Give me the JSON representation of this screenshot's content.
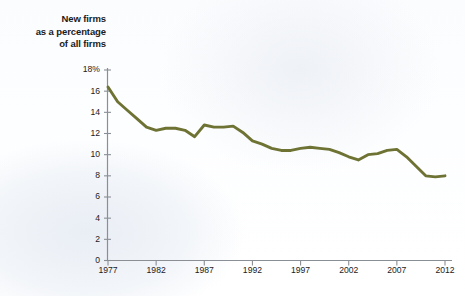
{
  "figure": {
    "title": "New firms\nas a percentage\nof all firms",
    "line_color": "#6e7334",
    "axis_color": "#8a8f96",
    "text_color": "#1b1b1b",
    "background_color": "#fbfcfe"
  },
  "chart_data": {
    "type": "line",
    "title": "New firms as a percentage of all firms",
    "xlabel": "",
    "ylabel": "New firms as a percentage of all firms",
    "xlim": [
      1977,
      2012
    ],
    "ylim": [
      0,
      18
    ],
    "ytick_labels": [
      "0",
      "2",
      "4",
      "6",
      "8",
      "10",
      "12",
      "14",
      "16",
      "18%"
    ],
    "ytick_values": [
      0,
      2,
      4,
      6,
      8,
      10,
      12,
      14,
      16,
      18
    ],
    "xtick_labels": [
      "1977",
      "1982",
      "1987",
      "1992",
      "1997",
      "2002",
      "2007",
      "2012"
    ],
    "xtick_values": [
      1977,
      1982,
      1987,
      1992,
      1997,
      2002,
      2007,
      2012
    ],
    "grid": false,
    "legend": null,
    "x": [
      1977,
      1978,
      1979,
      1980,
      1981,
      1982,
      1983,
      1984,
      1985,
      1986,
      1987,
      1988,
      1989,
      1990,
      1991,
      1992,
      1993,
      1994,
      1995,
      1996,
      1997,
      1998,
      1999,
      2000,
      2001,
      2002,
      2003,
      2004,
      2005,
      2006,
      2007,
      2008,
      2009,
      2010,
      2011,
      2012
    ],
    "values": [
      16.4,
      15.0,
      14.2,
      13.4,
      12.6,
      12.3,
      12.5,
      12.5,
      12.3,
      11.7,
      12.8,
      12.6,
      12.6,
      12.7,
      12.1,
      11.3,
      11.0,
      10.6,
      10.4,
      10.4,
      10.6,
      10.7,
      10.6,
      10.5,
      10.2,
      9.8,
      9.5,
      10.0,
      10.1,
      10.4,
      10.5,
      9.8,
      8.9,
      8.0,
      7.9,
      8.0
    ],
    "series_name": "New firms as a percentage of all firms"
  }
}
